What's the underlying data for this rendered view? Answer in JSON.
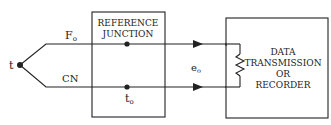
{
  "diagram": {
    "junction": {
      "label": "t"
    },
    "wires": {
      "top": {
        "label_main": "F",
        "label_sub": "o"
      },
      "bottom": {
        "label": "CN"
      }
    },
    "reference_box": {
      "line1": "REFERENCE",
      "line2": "JUNCTION",
      "temp_main": "t",
      "temp_sub": "o"
    },
    "output": {
      "label_main": "e",
      "label_sub": "o"
    },
    "data_box": {
      "line1": "DATA",
      "line2": "TRANSMISSION",
      "line3": "OR",
      "line4": "RECORDER"
    },
    "colors": {
      "line": "#222222",
      "background": "#ffffff"
    }
  }
}
